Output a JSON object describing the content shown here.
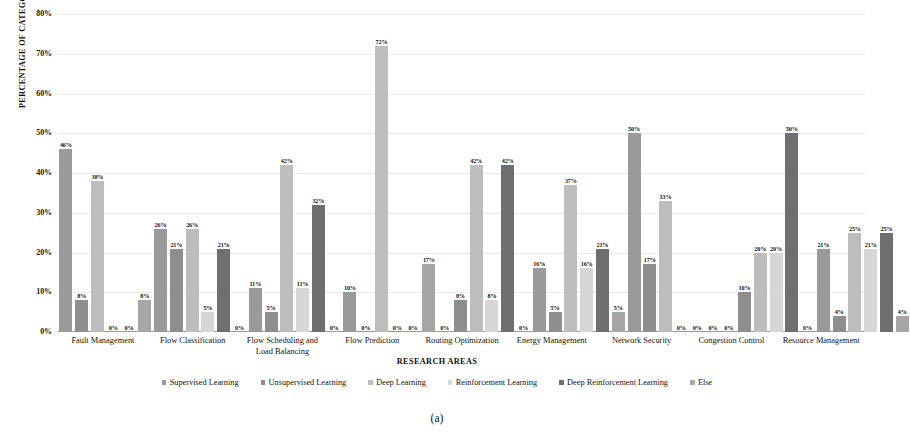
{
  "chart_data": {
    "type": "bar",
    "title": "",
    "subtitle": "",
    "xlabel": "RESEARCH AREAS",
    "ylabel": "PERCENTAGE OF CATEGORIES",
    "ylim": [
      0,
      80
    ],
    "ytick_labels": [
      "80%",
      "70%",
      "60%",
      "50%",
      "40%",
      "30%",
      "20%",
      "10%",
      "0%"
    ],
    "ytick_values": [
      80,
      70,
      60,
      50,
      40,
      30,
      20,
      10,
      0
    ],
    "grid": true,
    "legend_position": "bottom",
    "value_label_suffix": "%",
    "categories": [
      "Fault Management",
      "Flow Classification",
      "Flow Scheduling and Load Balancing",
      "Flow Prediction",
      "Routing Optimization",
      "Energy Management",
      "Network Security",
      "Congestion Control",
      "Resource Management"
    ],
    "category_display": [
      [
        "Fault Management"
      ],
      [
        "Flow Classification"
      ],
      [
        "Flow Scheduling and",
        "Load Balancing"
      ],
      [
        "Flow Prediction"
      ],
      [
        "Routing Optimization"
      ],
      [
        "Energy Management"
      ],
      [
        "Network Security"
      ],
      [
        "Congestion Control"
      ],
      [
        "Resource Management"
      ]
    ],
    "series": [
      {
        "name": "Supervised Learning",
        "color": "#9a9a9a",
        "values": [
          46,
          26,
          11,
          10,
          0,
          16,
          50,
          0,
          21
        ],
        "labels": [
          "46%",
          "26%",
          "11%",
          "10%",
          "0%",
          "16%",
          "50%",
          "0%",
          "21%"
        ]
      },
      {
        "name": "Unsupervised Learning",
        "color": "#8e8e8e",
        "values": [
          8,
          21,
          5,
          0,
          8,
          5,
          17,
          10,
          4
        ],
        "labels": [
          "8%",
          "21%",
          "5%",
          "0%",
          "8%",
          "5%",
          "17%",
          "10%",
          "4%"
        ]
      },
      {
        "name": "Deep Learning",
        "color": "#bdbdbd",
        "values": [
          38,
          26,
          42,
          72,
          42,
          37,
          33,
          20,
          25
        ],
        "labels": [
          "38%",
          "26%",
          "42%",
          "72%",
          "42%",
          "37%",
          "33%",
          "20%",
          "25%"
        ]
      },
      {
        "name": "Reinforcement Learning",
        "color": "#d6d6d6",
        "values": [
          0,
          5,
          11,
          0,
          8,
          16,
          0,
          20,
          21
        ],
        "labels": [
          "0%",
          "5%",
          "11%",
          "0%",
          "8%",
          "16%",
          "0%",
          "20%",
          "21%"
        ]
      },
      {
        "name": "Deep Reinforcement Learning",
        "color": "#6f6f6f",
        "values": [
          0,
          21,
          32,
          0,
          42,
          21,
          0,
          50,
          25
        ],
        "labels": [
          "0%",
          "21%",
          "32%",
          "0%",
          "42%",
          "21%",
          "0%",
          "50%",
          "25%"
        ]
      },
      {
        "name": "Else",
        "color": "#a6a6a6",
        "values": [
          8,
          0,
          0,
          17,
          0,
          5,
          0,
          0,
          4
        ],
        "labels": [
          "8%",
          "0%",
          "0%",
          "17%",
          "0%",
          "5%",
          "0%",
          "0%",
          "4%"
        ]
      }
    ]
  },
  "caption": "(a)",
  "colors": {
    "gridline": "#e9e9e9",
    "axis": "#9a9a9a",
    "text": "#111111"
  }
}
